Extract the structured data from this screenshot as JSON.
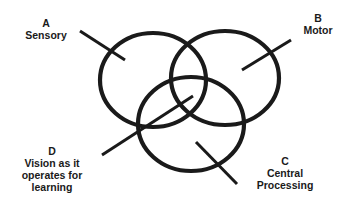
{
  "diagram": {
    "type": "venn",
    "stroke_color": "#1a1a1a",
    "background": "#ffffff",
    "circles": [
      {
        "id": "A",
        "letter": "A",
        "name": "Sensory",
        "cx": 153,
        "cy": 80,
        "rx": 53,
        "ry": 47
      },
      {
        "id": "B",
        "letter": "B",
        "name": "Motor",
        "cx": 225,
        "cy": 78,
        "rx": 54,
        "ry": 47
      },
      {
        "id": "C",
        "letter": "C",
        "name": "Central Processing",
        "cx": 191,
        "cy": 124,
        "rx": 53,
        "ry": 47
      }
    ],
    "labels": {
      "a": {
        "letter": "A",
        "line1": "Sensory"
      },
      "b": {
        "letter": "B",
        "line1": "Motor"
      },
      "c": {
        "letter": "C",
        "line1": "Central",
        "line2": "Processing"
      },
      "d": {
        "letter": "D",
        "line1": "Vision as it",
        "line2": "operates for",
        "line3": "learning"
      }
    },
    "pointers": [
      {
        "target": "A",
        "x1": 80,
        "y1": 31,
        "x2": 125,
        "y2": 60
      },
      {
        "target": "B",
        "x1": 291,
        "y1": 40,
        "x2": 242,
        "y2": 70
      },
      {
        "target": "C",
        "x1": 196,
        "y1": 142,
        "x2": 237,
        "y2": 184
      },
      {
        "target": "D",
        "x1": 102,
        "y1": 155,
        "x2": 193,
        "y2": 96
      }
    ]
  }
}
